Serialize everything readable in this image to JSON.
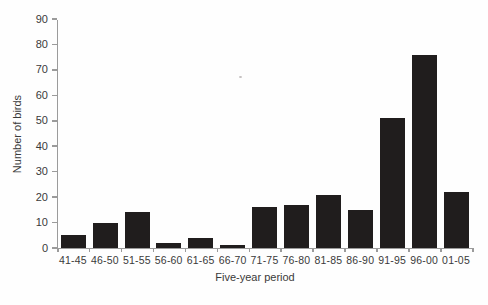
{
  "chart_data": {
    "type": "bar",
    "title": "",
    "categories": [
      "41-45",
      "46-50",
      "51-55",
      "56-60",
      "61-65",
      "66-70",
      "71-75",
      "76-80",
      "81-85",
      "86-90",
      "91-95",
      "96-00",
      "01-05"
    ],
    "values": [
      5,
      10,
      14,
      2,
      4,
      1,
      16,
      17,
      21,
      15,
      51,
      76,
      22
    ],
    "xlabel": "Five-year period",
    "ylabel": "Number of birds",
    "ylim": [
      0,
      90
    ],
    "yticks": [
      0,
      10,
      20,
      30,
      40,
      50,
      60,
      70,
      80,
      90
    ],
    "grid": false,
    "legend": "none",
    "bar_color": "#201d1d",
    "axis_color": "#9b9b9b",
    "text_color": "#3a3a3a"
  }
}
